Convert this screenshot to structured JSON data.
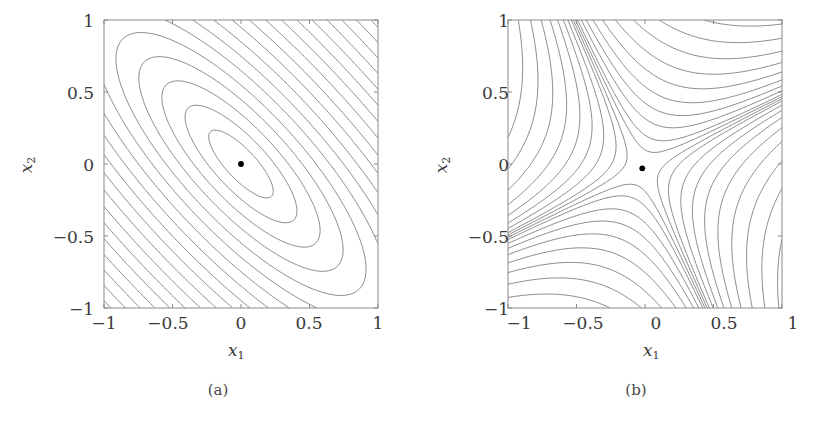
{
  "figure": {
    "background_color": "#ffffff",
    "line_color": "#555555",
    "text_color": "#3a3a3a",
    "marker_color": "#000000",
    "panels": [
      {
        "id": "a",
        "caption": "(a)",
        "xlabel": "x",
        "xlabel_sub": "1",
        "ylabel": "x",
        "ylabel_sub": "2",
        "xticks": [
          "−1",
          "−0.5",
          "0",
          "0.5",
          "1"
        ],
        "yticks": [
          "1",
          "0.5",
          "0",
          "−0.5",
          "−1"
        ],
        "xlim": [
          -1,
          1
        ],
        "ylim": [
          -1,
          1
        ],
        "marker_point": [
          0.0,
          0.0
        ]
      },
      {
        "id": "b",
        "caption": "(b)",
        "xlabel": "x",
        "xlabel_sub": "1",
        "ylabel": "x",
        "ylabel_sub": "2",
        "xticks": [
          "−1",
          "−0.5",
          "0",
          "0.5",
          "1"
        ],
        "yticks": [
          "1",
          "0.5",
          "0",
          "−0.5",
          "−1"
        ],
        "xlim": [
          -1,
          1
        ],
        "ylim": [
          -1,
          1
        ],
        "marker_point": [
          -0.02,
          -0.03
        ]
      }
    ]
  },
  "chart_data": [
    {
      "type": "contour",
      "panel": "a",
      "title": "",
      "xlabel": "x_1",
      "ylabel": "x_2",
      "xlim": [
        -1,
        1
      ],
      "ylim": [
        -1,
        1
      ],
      "xticks": [
        -1,
        -0.5,
        0,
        0.5,
        1
      ],
      "yticks": [
        -1,
        -0.5,
        0,
        0.5,
        1
      ],
      "grid": false,
      "legend": null,
      "description": "Concentric tilted elliptical contours of a positive-definite quadratic form; unique minimum marked by a filled dot at the origin.",
      "function": "f(x1,x2) = 1.00*x1^2 + 1.00*x2^2 + 1.60*x1*x2",
      "quadratic_form_matrix": [
        [
          1.0,
          0.8
        ],
        [
          0.8,
          1.0
        ]
      ],
      "definiteness": "positive definite",
      "eigenvalues": [
        1.8,
        0.2
      ],
      "ellipse_major_axis_angle_deg": 45,
      "critical_point": {
        "x": 0.0,
        "y": 0.0,
        "kind": "minimum"
      },
      "contour_levels": [
        0.02,
        0.06,
        0.12,
        0.2,
        0.3,
        0.42,
        0.56,
        0.72,
        0.9,
        1.1,
        1.32,
        1.56,
        1.82,
        2.1,
        2.4,
        2.72,
        3.06,
        3.42,
        3.8
      ],
      "n_contours_visible": 19
    },
    {
      "type": "contour",
      "panel": "b",
      "title": "",
      "xlabel": "x_1",
      "ylabel": "x_2",
      "xlim": [
        -1,
        1
      ],
      "ylim": [
        -1,
        1
      ],
      "xticks": [
        -1,
        -0.5,
        0,
        0.5,
        1
      ],
      "yticks": [
        -1,
        -0.5,
        0,
        0.5,
        1
      ],
      "grid": false,
      "legend": null,
      "description": "Hyperbolic (saddle) contours of an indefinite quadratic form; saddle point marked by a filled dot near the origin. Closed level curves appear in the lower-left and upper-right corners; dense nearly-parallel curves fill the upper-left and lower-right corners.",
      "function": "f(x1,x2) = -1.00*x1^2 + 1.00*x2^2 + 1.60*x1*x2",
      "quadratic_form_matrix": [
        [
          -1.0,
          0.8
        ],
        [
          0.8,
          1.0
        ]
      ],
      "definiteness": "indefinite",
      "eigenvalues": [
        1.28,
        -1.28
      ],
      "critical_point": {
        "x": -0.02,
        "y": -0.03,
        "kind": "saddle"
      },
      "contour_levels": [
        -2.0,
        -1.6,
        -1.25,
        -0.95,
        -0.7,
        -0.5,
        -0.34,
        -0.22,
        -0.13,
        -0.06,
        -0.02,
        0.02,
        0.06,
        0.13,
        0.22,
        0.34,
        0.5,
        0.7,
        0.95,
        1.25,
        1.6,
        2.0
      ],
      "n_contours_visible": 22
    }
  ]
}
